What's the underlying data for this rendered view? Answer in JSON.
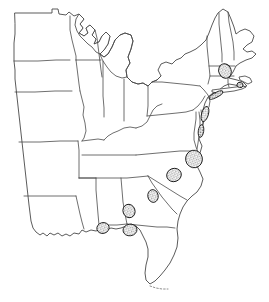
{
  "figure": {
    "type": "thematic-outline-map",
    "region": "Eastern United States",
    "projection_note": "simple outline, no graticule",
    "background_color": "#ffffff",
    "outline_color": "#2e2e2e",
    "border_color": "#4a4a4a",
    "marker_fill_color": "#8a8a8a",
    "marker_outline_color": "#1c1c1c",
    "marker_pattern": "stipple-hatch",
    "width_px": 269,
    "height_px": 302,
    "title": "",
    "subtitle": "",
    "legend": "",
    "scale_bar": "",
    "north_arrow": "",
    "labels_present": "none"
  },
  "chart_data": {
    "type": "scatter",
    "title": "",
    "xlabel": "",
    "ylabel": "",
    "grid": false,
    "legend_position": "none",
    "xlim": [
      0,
      269
    ],
    "ylim": [
      0,
      302
    ],
    "series": [
      {
        "name": "Occurrence sites",
        "marker_style": "stippled ellipse",
        "count": 10,
        "points": [
          {
            "id": "site-01",
            "x": 225,
            "y": 71,
            "rx": 6.2,
            "ry": 7.4,
            "rotation": -22,
            "area_class": "medium"
          },
          {
            "id": "site-02",
            "x": 240,
            "y": 85,
            "rx": 3.1,
            "ry": 2.6,
            "rotation": 10,
            "area_class": "small"
          },
          {
            "id": "site-03",
            "x": 216,
            "y": 95,
            "rx": 7.6,
            "ry": 2.4,
            "rotation": -28,
            "area_class": "small"
          },
          {
            "id": "site-04",
            "x": 205,
            "y": 114,
            "rx": 3.4,
            "ry": 7.8,
            "rotation": 16,
            "area_class": "medium"
          },
          {
            "id": "site-05",
            "x": 201,
            "y": 131,
            "rx": 2.7,
            "ry": 6.4,
            "rotation": 8,
            "area_class": "small"
          },
          {
            "id": "site-06",
            "x": 194,
            "y": 159,
            "rx": 8.4,
            "ry": 8.8,
            "rotation": -12,
            "area_class": "large"
          },
          {
            "id": "site-07",
            "x": 174,
            "y": 175,
            "rx": 7.4,
            "ry": 6.6,
            "rotation": -18,
            "area_class": "large"
          },
          {
            "id": "site-08",
            "x": 153,
            "y": 196,
            "rx": 5.2,
            "ry": 6.4,
            "rotation": -10,
            "area_class": "medium"
          },
          {
            "id": "site-09",
            "x": 129,
            "y": 211,
            "rx": 6.0,
            "ry": 6.8,
            "rotation": -20,
            "area_class": "medium"
          },
          {
            "id": "site-10",
            "x": 103,
            "y": 228,
            "rx": 6.2,
            "ry": 5.4,
            "rotation": -14,
            "area_class": "medium"
          },
          {
            "id": "site-11",
            "x": 130,
            "y": 230,
            "rx": 7.0,
            "ry": 5.8,
            "rotation": -8,
            "area_class": "medium"
          }
        ]
      }
    ]
  },
  "geography": {
    "coastline_name": "Atlantic and Gulf coast",
    "features": [
      {
        "name": "great-lakes",
        "label": ""
      },
      {
        "name": "florida-peninsula",
        "label": ""
      },
      {
        "name": "delmarva-peninsula",
        "label": ""
      },
      {
        "name": "long-island",
        "label": ""
      },
      {
        "name": "cape-cod",
        "label": ""
      },
      {
        "name": "florida-keys",
        "label": ""
      }
    ]
  }
}
